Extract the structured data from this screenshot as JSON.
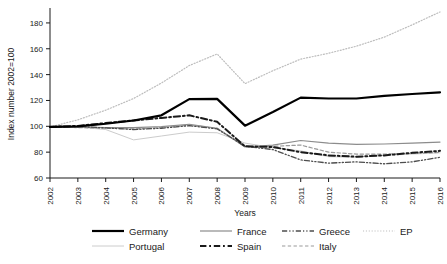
{
  "chart_data": {
    "type": "line",
    "title": "",
    "xlabel": "Years",
    "ylabel": "Index number 2002=100",
    "x": [
      2002,
      2003,
      2004,
      2005,
      2006,
      2007,
      2008,
      2009,
      2010,
      2011,
      2012,
      2013,
      2014,
      2015,
      2016
    ],
    "xlim": [
      2002,
      2016
    ],
    "ylim": [
      60,
      190
    ],
    "yticks": [
      60,
      80,
      100,
      120,
      140,
      160,
      180
    ],
    "xticks": [
      "2002",
      "2003",
      "2004",
      "2005",
      "2006",
      "2007",
      "2008",
      "2009",
      "2010",
      "2011",
      "2012",
      "2013",
      "2014",
      "2015",
      "2016"
    ],
    "grid": false,
    "legend_position": "bottom",
    "series": [
      {
        "name": "Germany",
        "style": "solid",
        "width": 2.2,
        "color": "#000000",
        "values": [
          99.5,
          100.0,
          102.0,
          104.5,
          108.5,
          121.0,
          121.2,
          100.5,
          111.0,
          122.2,
          121.5,
          121.5,
          123.5,
          125.0,
          126.3
        ]
      },
      {
        "name": "Portugal",
        "style": "solid",
        "width": 1.0,
        "color": "#cccccc",
        "values": [
          99.5,
          99.5,
          97.5,
          89.5,
          92.5,
          95.5,
          95.0,
          87.0,
          83.5,
          81.0,
          76.5,
          76.0,
          77.5,
          78.5,
          79.5
        ]
      },
      {
        "name": "France",
        "style": "solid",
        "width": 1.2,
        "color": "#8c8c8c",
        "values": [
          99.5,
          99.3,
          99.0,
          99.0,
          99.8,
          101.5,
          98.5,
          84.0,
          85.5,
          89.0,
          87.0,
          86.0,
          86.3,
          87.0,
          87.8
        ]
      },
      {
        "name": "Spain",
        "style": "dashdot",
        "width": 2.0,
        "color": "#1a1a1a",
        "values": [
          99.5,
          100.3,
          102.5,
          104.5,
          106.5,
          108.5,
          103.5,
          84.5,
          84.0,
          80.0,
          77.5,
          76.5,
          77.5,
          79.5,
          81.0
        ]
      },
      {
        "name": "Greece",
        "style": "dashdotdot",
        "width": 1.3,
        "color": "#4d4d4d",
        "values": [
          99.5,
          99.8,
          98.8,
          97.5,
          98.5,
          100.5,
          98.0,
          84.5,
          82.0,
          74.0,
          71.5,
          72.5,
          71.0,
          72.5,
          76.0
        ]
      },
      {
        "name": "Italy",
        "style": "dashed",
        "width": 1.2,
        "color": "#999999",
        "values": [
          99.5,
          99.0,
          98.5,
          98.0,
          99.0,
          101.0,
          98.5,
          84.5,
          84.5,
          85.5,
          80.0,
          78.5,
          78.5,
          79.0,
          79.8
        ]
      },
      {
        "name": "EP",
        "style": "dotted",
        "width": 1.2,
        "color": "#bdbdbd",
        "values": [
          99.5,
          105.0,
          112.5,
          121.5,
          133.5,
          147.0,
          156.0,
          133.0,
          143.0,
          152.0,
          156.5,
          162.0,
          169.0,
          178.5,
          188.5
        ]
      }
    ]
  },
  "legend": {
    "items": [
      {
        "label": "Germany"
      },
      {
        "label": "France"
      },
      {
        "label": "Greece"
      },
      {
        "label": "EP"
      },
      {
        "label": "Portugal"
      },
      {
        "label": "Spain"
      },
      {
        "label": "Italy"
      }
    ]
  }
}
